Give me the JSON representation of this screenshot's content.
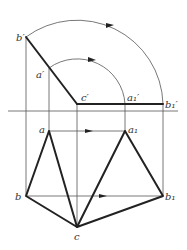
{
  "diagram": {
    "type": "descriptive-geometry-rotation",
    "labels": {
      "b_prime": "b′",
      "a_prime": "a′",
      "c_prime": "c′",
      "a1_prime": "a₁′",
      "b1_prime": "b₁′",
      "a": "a",
      "a1": "a₁",
      "b": "b",
      "b1": "b₁",
      "c": "c"
    },
    "points": {
      "b_prime": [
        26,
        37
      ],
      "a_prime": [
        49,
        68
      ],
      "c_prime": [
        77,
        104
      ],
      "a1_prime": [
        125,
        104
      ],
      "b1_prime": [
        163,
        104
      ],
      "a": [
        49,
        131
      ],
      "a1": [
        125,
        131
      ],
      "b": [
        26,
        196
      ],
      "b1": [
        163,
        196
      ],
      "c": [
        77,
        227
      ]
    },
    "axis_y": 111,
    "colors": {
      "line": "#222222",
      "thin": "#555555",
      "background": "#ffffff"
    }
  }
}
